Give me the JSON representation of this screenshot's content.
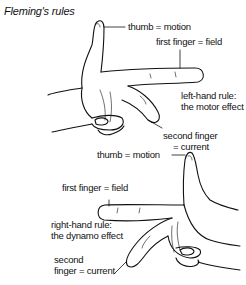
{
  "title": "Fleming's rules",
  "left_hand": {
    "thumb_label": "thumb = motion",
    "first_finger_label": "first finger = field",
    "rule_line1": "left-hand rule:",
    "rule_line2": "the motor effect",
    "second_finger_line1": "second finger",
    "second_finger_line2": "= current"
  },
  "right_hand": {
    "thumb_label": "thumb = motion",
    "first_finger_label": "first finger = field",
    "rule_line1": "right-hand rule:",
    "rule_line2": "the dynamo effect",
    "second_finger_line1": "second",
    "second_finger_line2": "finger = current"
  }
}
